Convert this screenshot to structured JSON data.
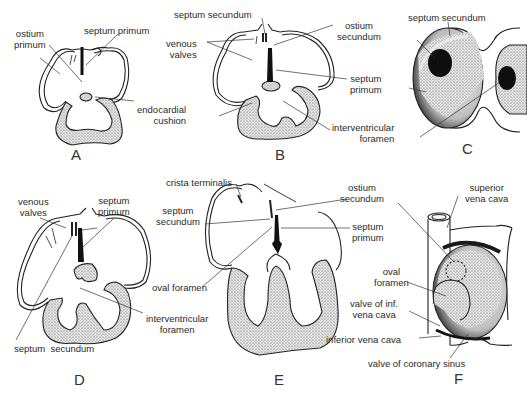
{
  "figure": {
    "panels": [
      {
        "id": "A",
        "letter": "A",
        "labels": {
          "ostium_primum": "ostium\nprimum",
          "septum_primum": "septum primum",
          "endocardial_cushion": "endocardial\ncushion"
        }
      },
      {
        "id": "B",
        "letter": "B",
        "labels": {
          "septum_secundum": "septum secundum",
          "venous_valves": "venous\nvalves",
          "ostium_secundum": "ostium\nsecundum",
          "septum_primum": "septum\nprimum",
          "interventricular_foramen": "interventricular\nforamen"
        }
      },
      {
        "id": "C",
        "letter": "C",
        "labels": {
          "septum_secundum": "septum secundum"
        }
      },
      {
        "id": "D",
        "letter": "D",
        "labels": {
          "venous_valves": "venous\nvalves",
          "septum_primum": "septum\nprimum",
          "interventricular_foramen": "interventricular\nforamen",
          "septum_secundum": "septum  secundum"
        }
      },
      {
        "id": "E",
        "letter": "E",
        "labels": {
          "crista_terminalis": "crista terminalis",
          "septum_secundum": "septum\nsecundum",
          "oval_foramen": "oval foramen",
          "ostium_secundum": "ostium\nsecundum",
          "septum_primum": "septum\nprimum"
        }
      },
      {
        "id": "F",
        "letter": "F",
        "labels": {
          "superior_vena_cava": "superior\nvena cava",
          "oval_foramen": "oval\nforamen",
          "valve_inf_vena_cava": "valve of inf.\nvena cava",
          "inferior_vena_cava": "inferior vena cava",
          "valve_coronary_sinus": "valve of coronary sinus"
        }
      }
    ]
  }
}
